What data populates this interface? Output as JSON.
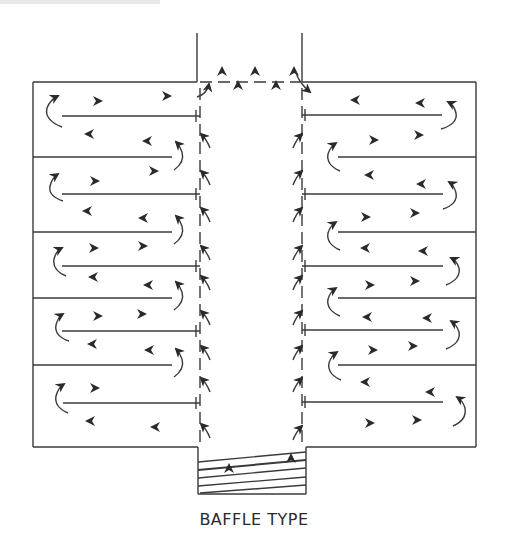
{
  "figure": {
    "caption": "BAFFLE TYPE",
    "colors": {
      "line": "#3a3a3a",
      "arrow": "#2a2a2a",
      "background": "#ffffff"
    }
  },
  "structure": {
    "outer_box": {
      "left": 33,
      "right": 476,
      "top": 82,
      "bottom": 447
    },
    "outlet_channel": {
      "left": 197,
      "right": 302,
      "top": 33,
      "bottom": 82
    },
    "central_corridor": {
      "left_wall_x": 200,
      "right_wall_x": 302,
      "style": "dashed"
    },
    "compartment_dividers_y": [
      157,
      232,
      298,
      365
    ],
    "compartments_per_side": 5,
    "inner_baffles": {
      "left_side_y": [
        118,
        196,
        266,
        331,
        405
      ],
      "right_side_y": [
        116,
        194,
        266,
        331,
        405
      ]
    },
    "inlet_baffle_box": {
      "left": 198,
      "right": 306,
      "top": 447,
      "bottom": 494,
      "sloped_lines": 5
    }
  },
  "flow": {
    "outlet_arrows": 6,
    "corridor_arrows_per_side": 10,
    "description": "Flow enters at bottom through sloped baffles, rises through central corridor, passes through dashed walls into serpentine compartments, exits at top outlet"
  }
}
